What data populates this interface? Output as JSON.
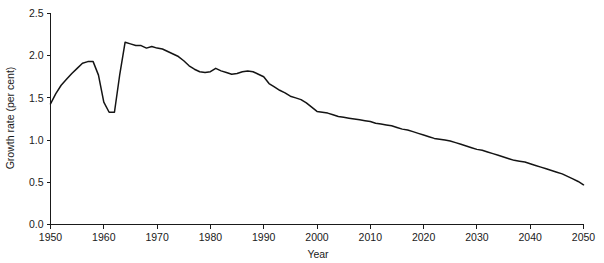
{
  "chart_data": {
    "type": "line",
    "title": "",
    "xlabel": "Year",
    "ylabel": "Growth rate (per cent)",
    "xlim": [
      1950,
      2050
    ],
    "ylim": [
      0.0,
      2.5
    ],
    "grid": false,
    "legend": null,
    "xticks": [
      1950,
      1960,
      1970,
      1980,
      1990,
      2000,
      2010,
      2020,
      2030,
      2040,
      2050
    ],
    "xtick_labels": [
      "1950",
      "1960",
      "1970",
      "1980",
      "1990",
      "2000",
      "2010",
      "2020",
      "2030",
      "2040",
      "2050"
    ],
    "yticks": [
      0.0,
      0.5,
      1.0,
      1.5,
      2.0,
      2.5
    ],
    "ytick_labels": [
      "0.0",
      "0.5",
      "1.0",
      "1.5",
      "2.0",
      "2.5"
    ],
    "line_color": "#141414",
    "series": [
      {
        "name": "World population growth rate",
        "x": [
          1950,
          1951,
          1952,
          1953,
          1954,
          1955,
          1956,
          1957,
          1958,
          1959,
          1960,
          1961,
          1962,
          1963,
          1964,
          1965,
          1966,
          1967,
          1968,
          1969,
          1970,
          1971,
          1972,
          1973,
          1974,
          1975,
          1976,
          1977,
          1978,
          1979,
          1980,
          1981,
          1982,
          1983,
          1984,
          1985,
          1986,
          1987,
          1988,
          1989,
          1990,
          1991,
          1992,
          1993,
          1994,
          1995,
          1996,
          1997,
          1998,
          1999,
          2000,
          2001,
          2002,
          2003,
          2004,
          2005,
          2006,
          2007,
          2008,
          2009,
          2010,
          2011,
          2012,
          2013,
          2014,
          2015,
          2016,
          2017,
          2018,
          2019,
          2020,
          2021,
          2022,
          2023,
          2024,
          2025,
          2026,
          2027,
          2028,
          2029,
          2030,
          2031,
          2032,
          2033,
          2034,
          2035,
          2036,
          2037,
          2038,
          2039,
          2040,
          2041,
          2042,
          2043,
          2044,
          2045,
          2046,
          2047,
          2048,
          2049,
          2050
        ],
        "y": [
          1.43,
          1.55,
          1.65,
          1.72,
          1.79,
          1.85,
          1.91,
          1.93,
          1.93,
          1.77,
          1.45,
          1.33,
          1.33,
          1.78,
          2.16,
          2.14,
          2.12,
          2.12,
          2.09,
          2.11,
          2.09,
          2.08,
          2.05,
          2.02,
          1.99,
          1.94,
          1.88,
          1.84,
          1.81,
          1.8,
          1.81,
          1.85,
          1.82,
          1.8,
          1.78,
          1.79,
          1.81,
          1.82,
          1.81,
          1.78,
          1.75,
          1.67,
          1.63,
          1.59,
          1.56,
          1.52,
          1.5,
          1.48,
          1.44,
          1.39,
          1.34,
          1.33,
          1.32,
          1.3,
          1.28,
          1.27,
          1.26,
          1.25,
          1.24,
          1.23,
          1.22,
          1.2,
          1.19,
          1.18,
          1.17,
          1.15,
          1.13,
          1.12,
          1.1,
          1.08,
          1.06,
          1.04,
          1.02,
          1.01,
          1.0,
          0.99,
          0.97,
          0.95,
          0.93,
          0.91,
          0.89,
          0.88,
          0.86,
          0.84,
          0.82,
          0.8,
          0.78,
          0.76,
          0.75,
          0.74,
          0.72,
          0.7,
          0.68,
          0.66,
          0.64,
          0.62,
          0.6,
          0.57,
          0.54,
          0.51,
          0.47
        ]
      }
    ]
  }
}
